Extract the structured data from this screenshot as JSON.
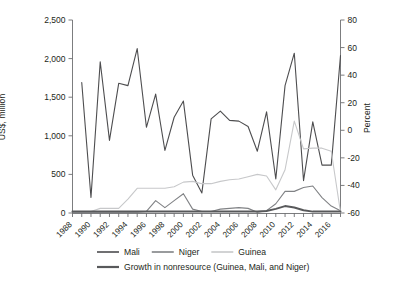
{
  "axes": {
    "ylabel_left": "US$, million",
    "ylabel_right": "Percent"
  },
  "legend": {
    "items": [
      {
        "label": "Mali",
        "color": "#4d4d4f"
      },
      {
        "label": "Niger",
        "color": "#808285"
      },
      {
        "label": "Guinea",
        "color": "#c7c8ca"
      },
      {
        "label": "Growth in nonresource (Guinea, Mali, and Niger)",
        "color": "#58595b"
      }
    ]
  },
  "chart_data": {
    "type": "line",
    "title": "",
    "subtitle": "",
    "xlabel": "",
    "ylabel": "US$, million",
    "y2label": "Percent",
    "grid": false,
    "legend_position": "bottom",
    "ylim": [
      0,
      2500
    ],
    "y2lim": [
      -60,
      80
    ],
    "yticks": [
      0,
      500,
      1000,
      1500,
      2000,
      2500
    ],
    "ytick_labels": [
      "0",
      "500",
      "1,000",
      "1,500",
      "2,000",
      "2,500"
    ],
    "y2ticks": [
      -60,
      -40,
      -20,
      0,
      20,
      40,
      60,
      80
    ],
    "y2tick_labels": [
      "-60",
      "-40",
      "-20",
      "0",
      "20",
      "40",
      "60",
      "80"
    ],
    "xlim": [
      1988,
      2017
    ],
    "xticks": [
      1988,
      1990,
      1992,
      1994,
      1996,
      1998,
      2000,
      2002,
      2004,
      2006,
      2008,
      2010,
      2012,
      2014,
      2016
    ],
    "xtick_labels": [
      "1988",
      "1990",
      "1992",
      "1994",
      "1996",
      "1998",
      "2000",
      "2002",
      "2004",
      "2006",
      "2008",
      "2010",
      "2012",
      "2014",
      "2016"
    ],
    "x": [
      1988,
      1989,
      1990,
      1991,
      1992,
      1993,
      1994,
      1995,
      1996,
      1997,
      1998,
      1999,
      2000,
      2001,
      2002,
      2003,
      2004,
      2005,
      2006,
      2007,
      2008,
      2009,
      2010,
      2011,
      2012,
      2013,
      2014,
      2015,
      2016,
      2017
    ],
    "series": [
      {
        "name": "Mali",
        "axis": "left",
        "color": "#4d4d4f",
        "units": "US$, million",
        "values": [
          null,
          1690,
          200,
          1960,
          940,
          1680,
          1650,
          2130,
          1110,
          1540,
          810,
          1240,
          1450,
          490,
          260,
          1220,
          1320,
          1200,
          1190,
          1120,
          800,
          1310,
          440,
          1650,
          2070,
          420,
          1180,
          620,
          620,
          2040
        ]
      },
      {
        "name": "Niger",
        "axis": "left",
        "color": "#808285",
        "units": "US$, million",
        "values": [
          10,
          10,
          10,
          10,
          10,
          10,
          10,
          10,
          20,
          160,
          70,
          160,
          250,
          50,
          20,
          20,
          50,
          60,
          70,
          60,
          10,
          30,
          120,
          280,
          280,
          330,
          350,
          200,
          90,
          30
        ]
      },
      {
        "name": "Guinea",
        "axis": "left",
        "color": "#c7c8ca",
        "units": "US$, million",
        "values": [
          20,
          20,
          20,
          60,
          60,
          60,
          180,
          320,
          320,
          320,
          320,
          340,
          400,
          410,
          380,
          380,
          410,
          430,
          440,
          470,
          500,
          480,
          300,
          560,
          1190,
          830,
          840,
          840,
          800,
          10
        ]
      },
      {
        "name": "Growth in nonresource (Guinea, Mali, and Niger)",
        "axis": "right",
        "color": "#58595b",
        "units": "Percent",
        "values": [
          -59,
          -59,
          -59,
          -59,
          -59,
          -59,
          -59,
          -59,
          -59,
          -59,
          -59,
          -59,
          -59,
          -59,
          -59,
          -59,
          -59,
          -59,
          -59,
          -59,
          -59,
          -58.5,
          -57,
          -55,
          -56,
          -58,
          -59,
          -59,
          -59,
          -59
        ]
      }
    ]
  }
}
